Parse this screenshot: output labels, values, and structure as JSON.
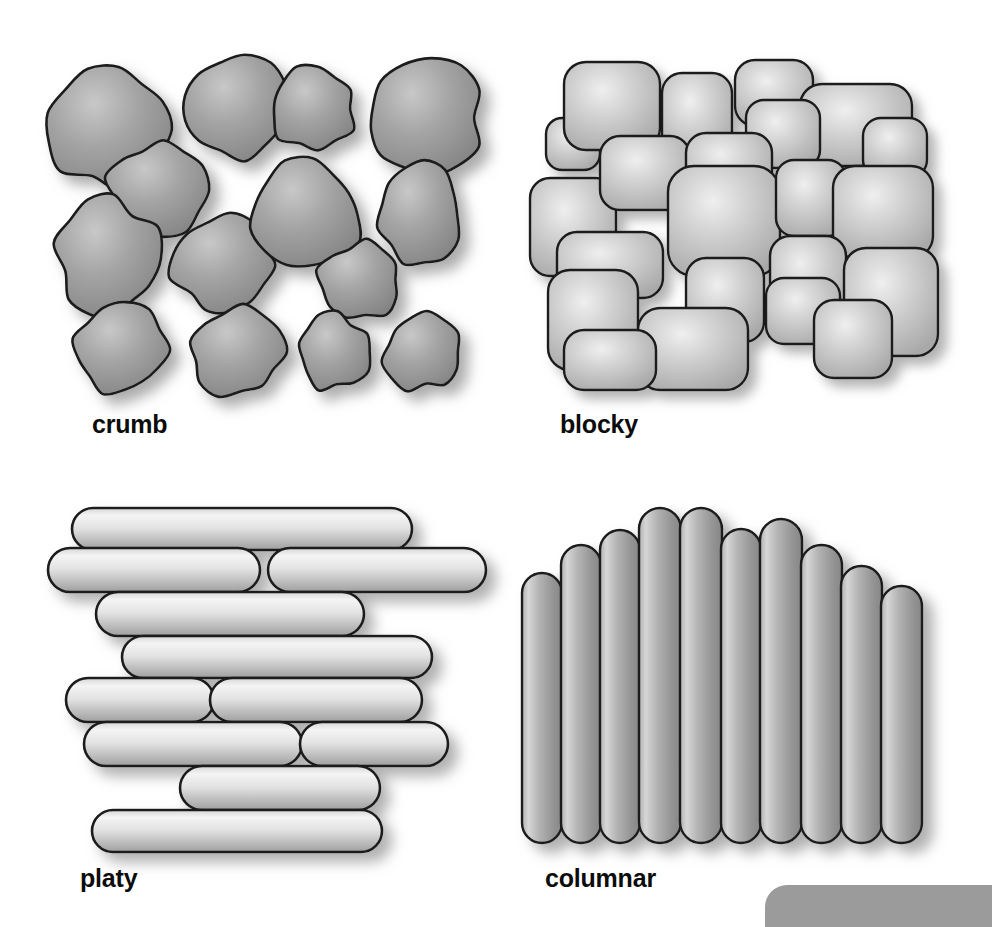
{
  "figure": {
    "background_color": "#ffffff",
    "width": 992,
    "height": 927,
    "outline_color": "#1a1a1a",
    "shadow_color": "#b4b4b4",
    "corner_tab_color": "#9b9b9b"
  },
  "panels": [
    {
      "id": "crumb",
      "label": "crumb",
      "label_x": 92,
      "label_y": 412,
      "fill_light": "#c6c6c6",
      "fill_mid": "#9a9a9a",
      "fill_dark": "#828282",
      "shape_kind": "irregular-rounded-blob",
      "aggregate_count": 13,
      "description": "rounded irregular crumb peds, loosely packed with visible pore space"
    },
    {
      "id": "blocky",
      "label": "blocky",
      "label_x": 560,
      "label_y": 412,
      "fill_light": "#f0f0f0",
      "fill_mid": "#c9c9c9",
      "fill_dark": "#a6a6a6",
      "shape_kind": "rounded-rectangle-block",
      "aggregate_count": 22,
      "description": "interlocking block-like peds with rounded corners, tightly fitted"
    },
    {
      "id": "platy",
      "label": "platy",
      "label_x": 80,
      "label_y": 866,
      "fill_light": "#f2f2f2",
      "fill_mid": "#d0d0d0",
      "fill_dark": "#a8a8a8",
      "shape_kind": "horizontal-plate",
      "aggregate_count": 11,
      "description": "flat horizontal plates stacked in overlapping layers"
    },
    {
      "id": "columnar",
      "label": "columnar",
      "label_x": 545,
      "label_y": 866,
      "fill_light": "#d4d4d4",
      "fill_mid": "#a3a3a3",
      "fill_dark": "#8a8a8a",
      "shape_kind": "vertical-column",
      "aggregate_count": 10,
      "description": "upright columns with rounded tops forming a domed upper surface"
    }
  ],
  "crumb_shapes": [
    {
      "cx": 111,
      "cy": 128,
      "rx": 62,
      "ry": 60,
      "seed": 1
    },
    {
      "cx": 238,
      "cy": 108,
      "rx": 55,
      "ry": 52,
      "seed": 2
    },
    {
      "cx": 313,
      "cy": 109,
      "rx": 42,
      "ry": 41,
      "seed": 3
    },
    {
      "cx": 424,
      "cy": 118,
      "rx": 60,
      "ry": 58,
      "seed": 4
    },
    {
      "cx": 157,
      "cy": 190,
      "rx": 48,
      "ry": 48,
      "seed": 5
    },
    {
      "cx": 107,
      "cy": 259,
      "rx": 52,
      "ry": 62,
      "seed": 6
    },
    {
      "cx": 224,
      "cy": 265,
      "rx": 52,
      "ry": 50,
      "seed": 7
    },
    {
      "cx": 306,
      "cy": 215,
      "rx": 55,
      "ry": 54,
      "seed": 8
    },
    {
      "cx": 419,
      "cy": 215,
      "rx": 43,
      "ry": 52,
      "seed": 9
    },
    {
      "cx": 361,
      "cy": 280,
      "rx": 41,
      "ry": 39,
      "seed": 10
    },
    {
      "cx": 120,
      "cy": 350,
      "rx": 46,
      "ry": 45,
      "seed": 11
    },
    {
      "cx": 237,
      "cy": 352,
      "rx": 48,
      "ry": 45,
      "seed": 12
    },
    {
      "cx": 333,
      "cy": 352,
      "rx": 37,
      "ry": 38,
      "seed": 13
    },
    {
      "cx": 422,
      "cy": 352,
      "rx": 38,
      "ry": 38,
      "seed": 14
    }
  ],
  "blocky_shapes": [
    {
      "x": 546,
      "y": 118,
      "w": 54,
      "h": 52,
      "r": 16
    },
    {
      "x": 564,
      "y": 62,
      "w": 96,
      "h": 88,
      "r": 22
    },
    {
      "x": 662,
      "y": 73,
      "w": 70,
      "h": 88,
      "r": 20
    },
    {
      "x": 735,
      "y": 60,
      "w": 78,
      "h": 66,
      "r": 20
    },
    {
      "x": 800,
      "y": 84,
      "w": 112,
      "h": 82,
      "r": 22
    },
    {
      "x": 746,
      "y": 100,
      "w": 74,
      "h": 68,
      "r": 18
    },
    {
      "x": 863,
      "y": 118,
      "w": 64,
      "h": 60,
      "r": 18
    },
    {
      "x": 530,
      "y": 178,
      "w": 86,
      "h": 98,
      "r": 20
    },
    {
      "x": 600,
      "y": 136,
      "w": 90,
      "h": 74,
      "r": 20
    },
    {
      "x": 686,
      "y": 133,
      "w": 86,
      "h": 66,
      "r": 20
    },
    {
      "x": 668,
      "y": 166,
      "w": 112,
      "h": 110,
      "r": 26
    },
    {
      "x": 776,
      "y": 160,
      "w": 70,
      "h": 76,
      "r": 18
    },
    {
      "x": 833,
      "y": 166,
      "w": 100,
      "h": 92,
      "r": 22
    },
    {
      "x": 557,
      "y": 232,
      "w": 106,
      "h": 66,
      "r": 20
    },
    {
      "x": 548,
      "y": 270,
      "w": 90,
      "h": 100,
      "r": 22
    },
    {
      "x": 686,
      "y": 258,
      "w": 78,
      "h": 84,
      "r": 20
    },
    {
      "x": 770,
      "y": 236,
      "w": 76,
      "h": 86,
      "r": 20
    },
    {
      "x": 844,
      "y": 248,
      "w": 94,
      "h": 108,
      "r": 22
    },
    {
      "x": 638,
      "y": 308,
      "w": 110,
      "h": 82,
      "r": 22
    },
    {
      "x": 766,
      "y": 278,
      "w": 74,
      "h": 66,
      "r": 18
    },
    {
      "x": 814,
      "y": 300,
      "w": 78,
      "h": 78,
      "r": 20
    },
    {
      "x": 564,
      "y": 330,
      "w": 92,
      "h": 60,
      "r": 20
    }
  ],
  "platy_shapes": [
    {
      "x": 72,
      "y": 508,
      "w": 340,
      "h": 42,
      "r": 21
    },
    {
      "x": 48,
      "y": 548,
      "w": 212,
      "h": 44,
      "r": 22
    },
    {
      "x": 268,
      "y": 548,
      "w": 218,
      "h": 44,
      "r": 22
    },
    {
      "x": 96,
      "y": 592,
      "w": 268,
      "h": 44,
      "r": 22
    },
    {
      "x": 122,
      "y": 636,
      "w": 310,
      "h": 42,
      "r": 21
    },
    {
      "x": 66,
      "y": 678,
      "w": 148,
      "h": 44,
      "r": 22
    },
    {
      "x": 210,
      "y": 678,
      "w": 212,
      "h": 44,
      "r": 22
    },
    {
      "x": 84,
      "y": 722,
      "w": 218,
      "h": 44,
      "r": 22
    },
    {
      "x": 300,
      "y": 722,
      "w": 148,
      "h": 44,
      "r": 22
    },
    {
      "x": 180,
      "y": 766,
      "w": 200,
      "h": 44,
      "r": 22
    },
    {
      "x": 92,
      "y": 810,
      "w": 290,
      "h": 42,
      "r": 21
    }
  ],
  "columnar_shapes": [
    {
      "x": 522,
      "y": 573,
      "w": 40,
      "h": 270,
      "r": 20
    },
    {
      "x": 561,
      "y": 545,
      "w": 40,
      "h": 298,
      "r": 20
    },
    {
      "x": 600,
      "y": 530,
      "w": 40,
      "h": 313,
      "r": 20
    },
    {
      "x": 639,
      "y": 508,
      "w": 42,
      "h": 335,
      "r": 21
    },
    {
      "x": 680,
      "y": 508,
      "w": 42,
      "h": 335,
      "r": 21
    },
    {
      "x": 721,
      "y": 529,
      "w": 40,
      "h": 314,
      "r": 20
    },
    {
      "x": 760,
      "y": 519,
      "w": 42,
      "h": 324,
      "r": 21
    },
    {
      "x": 801,
      "y": 545,
      "w": 41,
      "h": 298,
      "r": 20
    },
    {
      "x": 841,
      "y": 566,
      "w": 41,
      "h": 277,
      "r": 20
    },
    {
      "x": 881,
      "y": 586,
      "w": 41,
      "h": 257,
      "r": 20
    }
  ],
  "corner_tab": {
    "name": "corner-panel-tab",
    "x": 765,
    "y": 885,
    "width": 227,
    "height": 42
  }
}
